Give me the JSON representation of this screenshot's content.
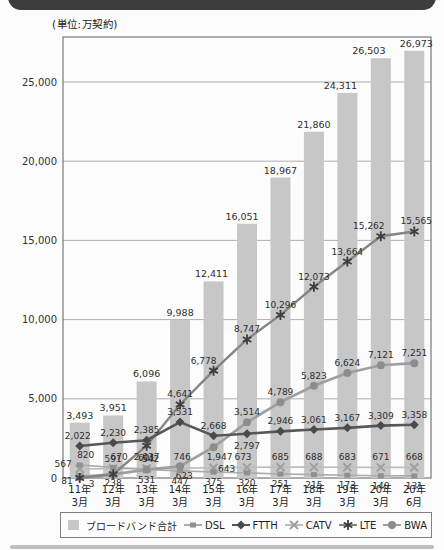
{
  "page": {
    "unit_label": "(単位:万契約)"
  },
  "chart_data": {
    "type": "combo bar+line",
    "title": "",
    "unit": "万契約",
    "categories": [
      "11年3月",
      "12年3月",
      "13年3月",
      "14年3月",
      "15年3月",
      "16年3月",
      "17年3月",
      "18年3月",
      "19年3月",
      "20年3月",
      "20年6月"
    ],
    "y_axis": {
      "ticks": [
        0,
        5000,
        10000,
        15000,
        20000,
        25000
      ],
      "max": 27800,
      "grid": true
    },
    "bar_series": {
      "name": "ブロードバンド合計",
      "values": [
        3493,
        3951,
        6096,
        9988,
        12411,
        16051,
        18967,
        21860,
        24311,
        26503,
        26973
      ]
    },
    "line_series": [
      {
        "name": "CATV",
        "marker": "x",
        "values": [
          567,
          591,
          601,
          623,
          643,
          673,
          685,
          688,
          683,
          671,
          668
        ],
        "hidden_labels": []
      },
      {
        "name": "DSL",
        "marker": "square",
        "values": [
          820,
          670,
          542,
          447,
          375,
          320,
          251,
          215,
          173,
          140,
          131
        ],
        "hidden_labels": []
      },
      {
        "name": "BWA",
        "marker": "circle",
        "values": [
          81,
          230,
          531,
          746,
          1947,
          3514,
          4789,
          5823,
          6624,
          7121,
          7251
        ],
        "hidden_labels": [
          1
        ]
      },
      {
        "name": "LTE",
        "marker": "asterisk",
        "values": [
          3,
          238,
          2037,
          4641,
          6778,
          8747,
          10296,
          12073,
          13664,
          15262,
          15565
        ],
        "hidden_labels": []
      },
      {
        "name": "FTTH",
        "marker": "diamond",
        "values": [
          2022,
          2230,
          2385,
          3531,
          2668,
          2797,
          2946,
          3061,
          3167,
          3309,
          3358
        ],
        "hidden_labels": []
      }
    ],
    "legend": [
      "ブロードバンド合計",
      "DSL",
      "FTTH",
      "CATV",
      "LTE",
      "BWA"
    ],
    "legend_position": "bottom"
  },
  "colors": {
    "banner": "#3d3d3d",
    "bar_fill": "#c7c7c7",
    "grid": "#9b9b9b",
    "plot_border": "#777777",
    "text": "#2b2b2b",
    "ftth_line": "#575757",
    "ftth_marker": "#4a4a4a",
    "lte_line": "#858585",
    "lte_marker": "#3d3d3d",
    "bwa_line": "#9e9e9e",
    "bwa_marker": "#8d8d8d",
    "dsl_line": "#ababab",
    "dsl_marker": "#909090",
    "catv_line": "#bdbdbd",
    "catv_marker": "#9f9f9f"
  }
}
